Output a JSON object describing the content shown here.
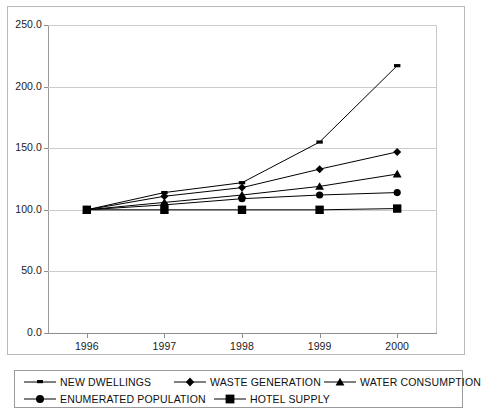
{
  "chart_data": {
    "type": "line",
    "title": "",
    "subtitle": "",
    "xlabel": "",
    "ylabel": "",
    "categories": [
      "1996",
      "1997",
      "1998",
      "1999",
      "2000"
    ],
    "x": [
      1996,
      1997,
      1998,
      1999,
      2000
    ],
    "ylim": [
      0.0,
      250.0
    ],
    "ytick_labels": [
      "0.0",
      "50.0",
      "100.0",
      "150.0",
      "200.0",
      "250.0"
    ],
    "ytick_values": [
      0.0,
      50.0,
      100.0,
      150.0,
      200.0,
      250.0
    ],
    "grid": true,
    "legend_position": "bottom",
    "series": [
      {
        "name": "NEW DWELLINGS",
        "marker": "dash",
        "color": "#000000",
        "values": [
          100,
          114,
          122,
          155,
          217
        ]
      },
      {
        "name": "WASTE GENERATION",
        "marker": "diamond",
        "color": "#000000",
        "values": [
          100,
          111,
          118,
          133,
          147
        ]
      },
      {
        "name": "WATER CONSUMPTION",
        "marker": "triangle",
        "color": "#000000",
        "values": [
          100,
          106,
          112,
          119,
          129
        ]
      },
      {
        "name": "ENUMERATED POPULATION",
        "marker": "circle",
        "color": "#000000",
        "values": [
          100,
          104,
          109,
          112,
          114
        ]
      },
      {
        "name": "HOTEL SUPPLY",
        "marker": "square",
        "color": "#000000",
        "values": [
          100,
          100,
          100,
          100,
          101
        ]
      }
    ]
  },
  "axes": {
    "y_ticks": [
      {
        "label": "250.0",
        "value": 250.0
      },
      {
        "label": "200.0",
        "value": 200.0
      },
      {
        "label": "150.0",
        "value": 150.0
      },
      {
        "label": "100.0",
        "value": 100.0
      },
      {
        "label": "50.0",
        "value": 50.0
      },
      {
        "label": "0.0",
        "value": 0.0
      }
    ],
    "x_ticks": [
      {
        "label": "1996"
      },
      {
        "label": "1997"
      },
      {
        "label": "1998"
      },
      {
        "label": "1999"
      },
      {
        "label": "2000"
      }
    ]
  },
  "legend": {
    "entries": [
      {
        "label": "NEW DWELLINGS",
        "marker": "dash-marker-icon"
      },
      {
        "label": "WASTE GENERATION",
        "marker": "diamond-marker-icon"
      },
      {
        "label": "WATER CONSUMPTION",
        "marker": "triangle-marker-icon"
      },
      {
        "label": "ENUMERATED POPULATION",
        "marker": "circle-marker-icon"
      },
      {
        "label": "HOTEL SUPPLY",
        "marker": "square-marker-icon"
      }
    ]
  }
}
